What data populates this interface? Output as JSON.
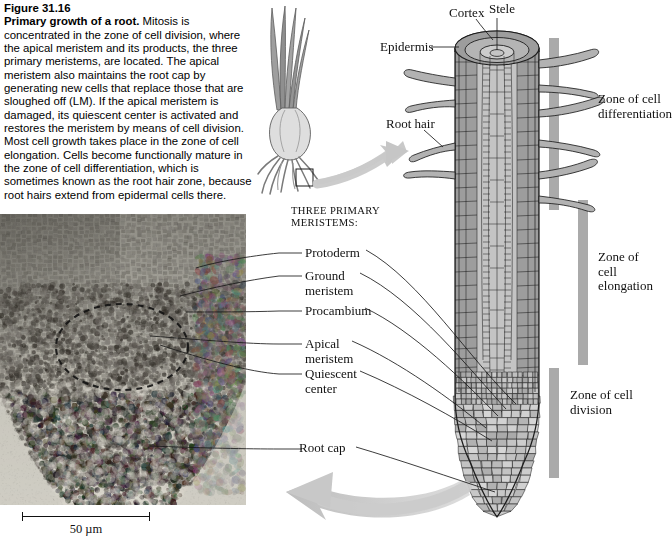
{
  "figure": {
    "number": "Figure 31.16",
    "title": "Primary growth of a root.",
    "body": " Mitosis is concentrated in the zone of cell division, where the apical meristem and its products, the three primary meristems, are located. The apical meristem also maintains the root cap by generating new cells that replace those that are sloughed off (LM). If the apical meristem is damaged, its quiescent center is activated and restores the meristem by means of cell division. Most cell growth takes place in the zone of cell elongation. Cells become functionally mature in the zone of cell differentiation, which is sometimes known as the root hair zone, because root hairs extend from epidermal cells there."
  },
  "diagram_labels": {
    "cortex": "Cortex",
    "stele": "Stele",
    "epidermis": "Epidermis",
    "root_hair": "Root hair",
    "root_cap": "Root cap"
  },
  "zones": [
    {
      "id": "differentiation",
      "line1": "Zone of cell",
      "line2": "differentiation"
    },
    {
      "id": "elongation",
      "line1": "Zone of cell",
      "line2": "elongation"
    },
    {
      "id": "division",
      "line1": "Zone of cell",
      "line2": "division"
    }
  ],
  "meristems": {
    "heading_line1": "THREE PRIMARY",
    "heading_line2": "MERISTEMS:",
    "items": [
      {
        "id": "protoderm",
        "line1": "Protoderm",
        "line2": ""
      },
      {
        "id": "ground-meristem",
        "line1": "Ground",
        "line2": "meristem"
      },
      {
        "id": "procambium",
        "line1": "Procambium",
        "line2": ""
      }
    ]
  },
  "tip_labels": [
    {
      "id": "apical-meristem",
      "line1": "Apical",
      "line2": "meristem"
    },
    {
      "id": "quiescent-center",
      "line1": "Quiescent",
      "line2": "center"
    }
  ],
  "scale_bar": {
    "label": "50 µm"
  },
  "colors": {
    "zone_bar": "#aaaaaa",
    "arrow": "#c9c9c9",
    "cortex_fill": "#9d9d9d",
    "stele_fill": "#c8c8c8",
    "epidermis_fill": "#8a8a8a",
    "plant_sketch": "#8c8c8c",
    "ink": "#1a1a1a"
  },
  "icons": {
    "plant_sketch": "onion-plant-sketch",
    "magnify_box": "inset-box-icon",
    "arrow_to_diagram": "curved-arrow-right-icon",
    "arrow_to_micrograph": "curved-arrow-left-icon"
  }
}
